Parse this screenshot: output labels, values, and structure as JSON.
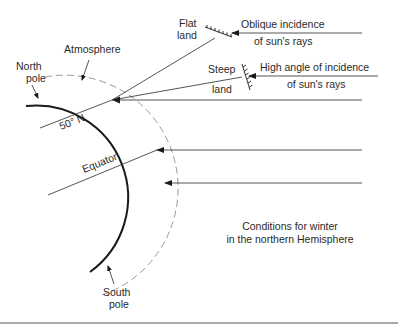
{
  "diagram": {
    "caption": {
      "line1": "Conditions for winter",
      "line2": "in the northern Hemisphere"
    },
    "labels": {
      "north_pole_1": "North",
      "north_pole_2": "pole",
      "south_pole_1": "South",
      "south_pole_2": "pole",
      "atmosphere": "Atmosphere",
      "latitude": "50° N",
      "equator": "Equator",
      "flat_land_1": "Flat",
      "flat_land_2": "land",
      "steep_land_1": "Steep",
      "steep_land_2": "land",
      "oblique_1": "Oblique incidence",
      "oblique_2": "of sun's rays",
      "high_angle_1": "High angle of incidence",
      "high_angle_2": "of sun's rays"
    },
    "colors": {
      "line": "#2a2a2a",
      "earth": "#1a1a1a",
      "atmosphere": "#9a9a9a",
      "rule": "#555555"
    },
    "elements": [
      {
        "type": "earth-arc",
        "from": "North pole",
        "to": "South pole"
      },
      {
        "type": "atmosphere-arc",
        "style": "dashed"
      },
      {
        "type": "sun-ray",
        "label": "Oblique incidence of sun's rays",
        "target": "Flat land"
      },
      {
        "type": "sun-ray",
        "label": "High angle of incidence of sun's rays",
        "target": "Steep land"
      },
      {
        "type": "sun-ray",
        "target": "50° N surface"
      },
      {
        "type": "sun-ray",
        "target": "Equator region"
      },
      {
        "type": "sun-ray",
        "target": "Southern surface"
      }
    ]
  }
}
